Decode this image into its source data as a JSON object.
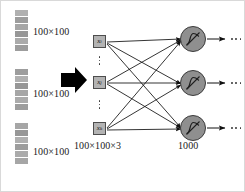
{
  "diagram": {
    "input_stacks": [
      {
        "label": "100×100",
        "cells": 6
      },
      {
        "label": "100×100",
        "cells": 6
      },
      {
        "label": "100×100",
        "cells": 6
      }
    ],
    "transform_arrow": "thick-right-arrow",
    "input_nodes": [
      {
        "symbol": "x",
        "subscript": "i"
      },
      {
        "symbol": "x",
        "subscript": "j"
      },
      {
        "symbol": "x",
        "subscript": "k"
      }
    ],
    "input_layer_label": "100×100×3",
    "hidden_layer_label": "1000",
    "hidden_units": [
      {
        "activation": "sigmoid"
      },
      {
        "activation": "sigmoid"
      },
      {
        "activation": "sigmoid"
      }
    ],
    "vertical_ellipsis": "⋮",
    "horizontal_ellipsis": "…",
    "colors": {
      "stack_fill": "#a8a8a8",
      "node_fill": "#b3b3b3",
      "node_stroke": "#4d4d4d",
      "neuron_fill": "#8f8f8f",
      "neuron_stroke": "#3b3b3b",
      "edge": "#1a1a1a",
      "text": "#1a1a1a",
      "background": "#ffffff"
    }
  }
}
